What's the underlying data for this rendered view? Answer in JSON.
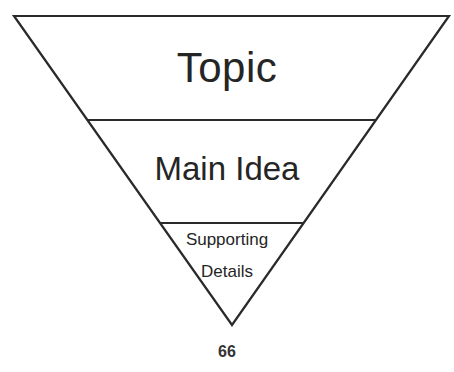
{
  "diagram": {
    "type": "inverted-pyramid",
    "levels": [
      {
        "label": "Topic"
      },
      {
        "label": "Main Idea"
      },
      {
        "label_lines": [
          "Supporting",
          "Details"
        ]
      }
    ]
  },
  "page_number": "66"
}
